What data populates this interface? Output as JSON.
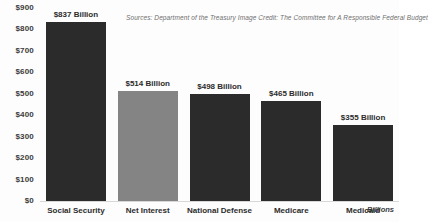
{
  "caption": {
    "source_text": "Sources: Department of the Treasury  Image Credit: The Committee for A Responsible Federal Budget"
  },
  "axis": {
    "y_title": "Billions",
    "y_ticks": [
      "$900",
      "$800",
      "$700",
      "$600",
      "$500",
      "$400",
      "$300",
      "$200",
      "$100",
      "$0"
    ]
  },
  "colors": {
    "bar_dark": "#2b2b2b",
    "bar_light": "#848484",
    "background": "#fdfdfd",
    "text": "#2c2c2c",
    "caption": "#6f6f6f"
  },
  "chart_data": {
    "type": "bar",
    "title": "",
    "xlabel": "",
    "ylabel": "Billions",
    "ylim": [
      0,
      900
    ],
    "grid": false,
    "legend": "none",
    "categories": [
      "Social Security",
      "Net Interest",
      "National Defense",
      "Medicare",
      "Medicaid"
    ],
    "values": [
      837,
      514,
      498,
      465,
      355
    ],
    "data_labels": [
      "$837 Billion",
      "$514 Billion",
      "$498 Billion",
      "$465 Billion",
      "$355 Billion"
    ],
    "bar_colors": [
      "#2b2b2b",
      "#848484",
      "#2b2b2b",
      "#2b2b2b",
      "#2b2b2b"
    ],
    "tick_values": [
      900,
      800,
      700,
      600,
      500,
      400,
      300,
      200,
      100,
      0
    ],
    "tick_labels": [
      "$900",
      "$800",
      "$700",
      "$600",
      "$500",
      "$400",
      "$300",
      "$200",
      "$100",
      "$0"
    ],
    "annotations": [
      "Sources: Department of the Treasury  Image Credit: The Committee for A Responsible Federal Budget"
    ]
  }
}
